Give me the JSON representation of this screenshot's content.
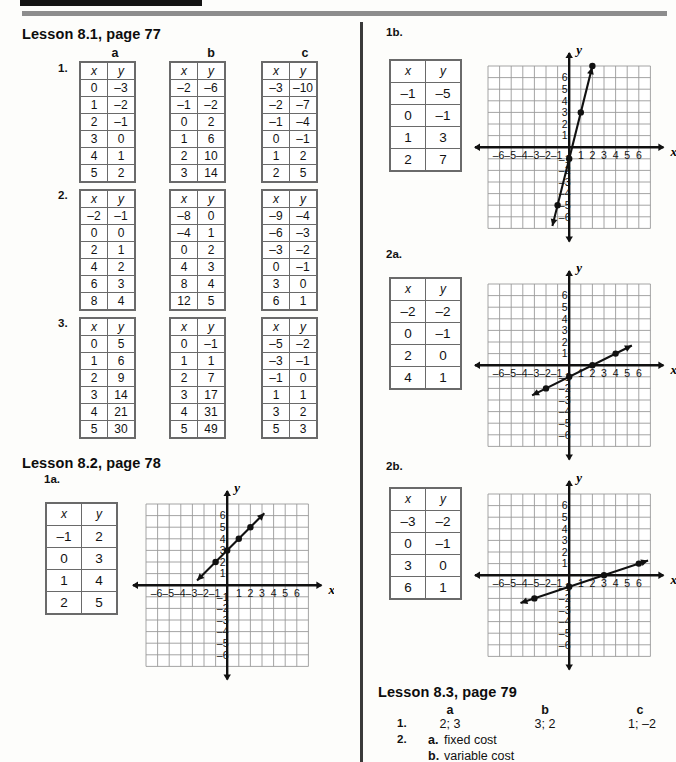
{
  "page": {
    "width": 671,
    "height": 762,
    "background": "#fdfdfb",
    "rule_color": "#8d8d8d",
    "bar_color": "#141414"
  },
  "lesson81": {
    "heading": "Lesson 8.1, page 77",
    "column_headers": [
      "a",
      "b",
      "c"
    ],
    "problems": [
      {
        "number": "1.",
        "tables": [
          {
            "headers": [
              "x",
              "y"
            ],
            "rows": [
              [
                "0",
                "–3"
              ],
              [
                "1",
                "–2"
              ],
              [
                "2",
                "–1"
              ],
              [
                "3",
                "0"
              ],
              [
                "4",
                "1"
              ],
              [
                "5",
                "2"
              ]
            ]
          },
          {
            "headers": [
              "x",
              "y"
            ],
            "rows": [
              [
                "–2",
                "–6"
              ],
              [
                "–1",
                "–2"
              ],
              [
                "0",
                "2"
              ],
              [
                "1",
                "6"
              ],
              [
                "2",
                "10"
              ],
              [
                "3",
                "14"
              ]
            ]
          },
          {
            "headers": [
              "x",
              "y"
            ],
            "rows": [
              [
                "–3",
                "–10"
              ],
              [
                "–2",
                "–7"
              ],
              [
                "–1",
                "–4"
              ],
              [
                "0",
                "–1"
              ],
              [
                "1",
                "2"
              ],
              [
                "2",
                "5"
              ]
            ]
          }
        ]
      },
      {
        "number": "2.",
        "tables": [
          {
            "headers": [
              "x",
              "y"
            ],
            "rows": [
              [
                "–2",
                "–1"
              ],
              [
                "0",
                "0"
              ],
              [
                "2",
                "1"
              ],
              [
                "4",
                "2"
              ],
              [
                "6",
                "3"
              ],
              [
                "8",
                "4"
              ]
            ]
          },
          {
            "headers": [
              "x",
              "y"
            ],
            "rows": [
              [
                "–8",
                "0"
              ],
              [
                "–4",
                "1"
              ],
              [
                "0",
                "2"
              ],
              [
                "4",
                "3"
              ],
              [
                "8",
                "4"
              ],
              [
                "12",
                "5"
              ]
            ]
          },
          {
            "headers": [
              "x",
              "y"
            ],
            "rows": [
              [
                "–9",
                "–4"
              ],
              [
                "–6",
                "–3"
              ],
              [
                "–3",
                "–2"
              ],
              [
                "0",
                "–1"
              ],
              [
                "3",
                "0"
              ],
              [
                "6",
                "1"
              ]
            ]
          }
        ]
      },
      {
        "number": "3.",
        "tables": [
          {
            "headers": [
              "x",
              "y"
            ],
            "rows": [
              [
                "0",
                "5"
              ],
              [
                "1",
                "6"
              ],
              [
                "2",
                "9"
              ],
              [
                "3",
                "14"
              ],
              [
                "4",
                "21"
              ],
              [
                "5",
                "30"
              ]
            ]
          },
          {
            "headers": [
              "x",
              "y"
            ],
            "rows": [
              [
                "0",
                "–1"
              ],
              [
                "1",
                "1"
              ],
              [
                "2",
                "7"
              ],
              [
                "3",
                "17"
              ],
              [
                "4",
                "31"
              ],
              [
                "5",
                "49"
              ]
            ]
          },
          {
            "headers": [
              "x",
              "y"
            ],
            "rows": [
              [
                "–5",
                "–2"
              ],
              [
                "–3",
                "–1"
              ],
              [
                "–1",
                "0"
              ],
              [
                "1",
                "1"
              ],
              [
                "3",
                "2"
              ],
              [
                "5",
                "3"
              ]
            ]
          }
        ]
      }
    ]
  },
  "lesson82": {
    "heading": "Lesson 8.2, page 78",
    "items": [
      {
        "label": "1a.",
        "table": {
          "headers": [
            "x",
            "y"
          ],
          "rows": [
            [
              "–1",
              "2"
            ],
            [
              "0",
              "3"
            ],
            [
              "1",
              "4"
            ],
            [
              "2",
              "5"
            ]
          ]
        },
        "graph": {
          "axis_x_label": "x",
          "axis_y_label": "y",
          "x_ticks": [
            "–6",
            "–5",
            "–4",
            "–3",
            "–2",
            "–1",
            "1",
            "2",
            "3",
            "4",
            "5",
            "6"
          ],
          "y_ticks": [
            "6",
            "5",
            "4",
            "3",
            "2",
            "1",
            "–1",
            "–2",
            "–3",
            "–4",
            "–5",
            "–6"
          ],
          "points": [
            [
              -1,
              2
            ],
            [
              0,
              3
            ],
            [
              1,
              4
            ],
            [
              2,
              5
            ]
          ],
          "line": {
            "slope": 1,
            "intercept": 3,
            "from_x": -2.6,
            "to_x": 3.2
          }
        }
      },
      {
        "label": "1b.",
        "table": {
          "headers": [
            "x",
            "y"
          ],
          "rows": [
            [
              "–1",
              "–5"
            ],
            [
              "0",
              "–1"
            ],
            [
              "1",
              "3"
            ],
            [
              "2",
              "7"
            ]
          ]
        },
        "graph": {
          "axis_x_label": "x",
          "axis_y_label": "y",
          "x_ticks": [
            "–6",
            "–5",
            "–4",
            "–3",
            "–2",
            "–1",
            "1",
            "2",
            "3",
            "4",
            "5",
            "6"
          ],
          "y_ticks": [
            "6",
            "5",
            "4",
            "3",
            "2",
            "1",
            "–1",
            "–2",
            "–3",
            "–4",
            "–5",
            "–6"
          ],
          "points": [
            [
              -1,
              -5
            ],
            [
              0,
              -1
            ],
            [
              1,
              3
            ],
            [
              2,
              7
            ]
          ],
          "line": {
            "slope": 4,
            "intercept": -1,
            "from_x": -1.45,
            "to_x": 2.25
          }
        }
      },
      {
        "label": "2a.",
        "table": {
          "headers": [
            "x",
            "y"
          ],
          "rows": [
            [
              "–2",
              "–2"
            ],
            [
              "0",
              "–1"
            ],
            [
              "2",
              "0"
            ],
            [
              "4",
              "1"
            ]
          ]
        },
        "graph": {
          "axis_x_label": "x",
          "axis_y_label": "y",
          "x_ticks": [
            "–6",
            "–5",
            "–4",
            "–3",
            "–2",
            "–1",
            "1",
            "2",
            "3",
            "4",
            "5",
            "6"
          ],
          "y_ticks": [
            "6",
            "5",
            "4",
            "3",
            "2",
            "1",
            "–1",
            "–2",
            "–3",
            "–4",
            "–5",
            "–6"
          ],
          "points": [
            [
              -2,
              -2
            ],
            [
              0,
              -1
            ],
            [
              2,
              0
            ],
            [
              4,
              1
            ]
          ],
          "line": {
            "slope": 0.5,
            "intercept": -1,
            "from_x": -3.2,
            "to_x": 5.4
          }
        }
      },
      {
        "label": "2b.",
        "table": {
          "headers": [
            "x",
            "y"
          ],
          "rows": [
            [
              "–3",
              "–2"
            ],
            [
              "0",
              "–1"
            ],
            [
              "3",
              "0"
            ],
            [
              "6",
              "1"
            ]
          ]
        },
        "graph": {
          "axis_x_label": "x",
          "axis_y_label": "y",
          "x_ticks": [
            "–6",
            "–5",
            "–4",
            "–5",
            "–2",
            "–1",
            "1",
            "2",
            "3",
            "4",
            "5",
            "6"
          ],
          "y_ticks": [
            "6",
            "5",
            "4",
            "3",
            "2",
            "1",
            "–1",
            "–2",
            "–3",
            "–4",
            "–5",
            "–6"
          ],
          "points": [
            [
              -3,
              -2
            ],
            [
              0,
              -1
            ],
            [
              3,
              0
            ],
            [
              6,
              1
            ]
          ],
          "line": {
            "slope": 0.3333,
            "intercept": -1,
            "from_x": -4.2,
            "to_x": 6.8
          }
        }
      }
    ]
  },
  "lesson83": {
    "heading": "Lesson 8.3, page 79",
    "column_headers": [
      "a",
      "b",
      "c"
    ],
    "rows": [
      {
        "number": "1.",
        "a": "2; 3",
        "b": "3; 2",
        "c": "1; –2"
      },
      {
        "number": "2.",
        "a_label": "a.",
        "a_text": "fixed cost",
        "b_label": "b.",
        "b_text": "variable cost"
      }
    ]
  }
}
